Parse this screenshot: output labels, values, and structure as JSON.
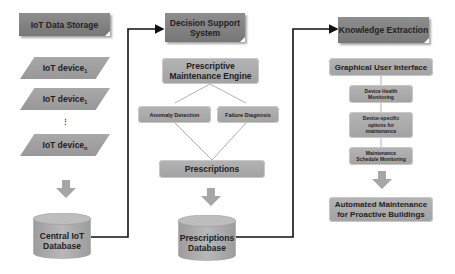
{
  "columns": {
    "iot": {
      "header": "IoT Data Storage",
      "devices": [
        {
          "label": "IoT device",
          "sub": "1"
        },
        {
          "label": "IoT device",
          "sub": "1"
        },
        {
          "label": "IoT device",
          "sub": "n"
        }
      ],
      "ellipsis": "⋮",
      "database": {
        "line1": "Central IoT",
        "line2": "Database"
      }
    },
    "dss": {
      "header_line1": "Decision Support",
      "header_line2": "System",
      "engine_line1": "Prescriptive",
      "engine_line2": "Maintenance Engine",
      "anomaly": "Anomaly Detection",
      "failure": "Failure Diagnosis",
      "prescriptions": "Prescriptions",
      "database": {
        "line1": "Prescriptions",
        "line2": "Database"
      }
    },
    "ke": {
      "header": "Knowledge Extraction",
      "gui": "Graphical User Interface",
      "steps": [
        {
          "line1": "Device Health",
          "line2": "Monitoring"
        },
        {
          "line1": "Device-specific",
          "line2": "options for",
          "line3": "maintenance"
        },
        {
          "line1": "Maintenance",
          "line2": "Schedule Monitoring"
        }
      ],
      "result_line1": "Automated Maintenance",
      "result_line2": "for Proactive Buildings"
    }
  },
  "colors": {
    "header": "#808080",
    "box": "#a8a8a8",
    "connector": "#111111",
    "thin_line": "#9a9a9a"
  }
}
